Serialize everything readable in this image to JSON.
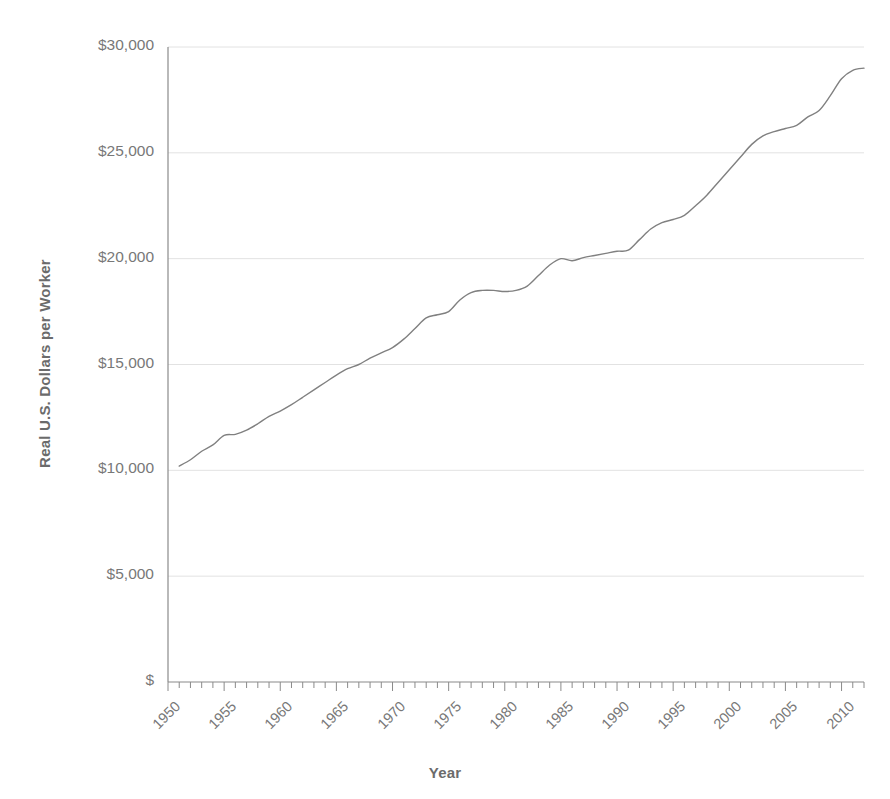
{
  "figure": {
    "background_color": "#ffffff",
    "plot_area": {
      "left": 168,
      "right": 864,
      "top": 47,
      "bottom": 682
    }
  },
  "axes": {
    "y_title": "Real U.S. Dollars per Worker",
    "x_title": "Year",
    "y_tick_labels": [
      "$30,000",
      "$25,000",
      "$20,000",
      "$15,000",
      "$10,000",
      "$5,000",
      "$"
    ],
    "y_tick_values": [
      30000,
      25000,
      20000,
      15000,
      10000,
      5000,
      0
    ],
    "x_tick_labels": [
      "1950",
      "1955",
      "1960",
      "1965",
      "1970",
      "1975",
      "1980",
      "1985",
      "1990",
      "1995",
      "2000",
      "2005",
      "2010"
    ],
    "x_tick_values": [
      1950,
      1955,
      1960,
      1965,
      1970,
      1975,
      1980,
      1985,
      1990,
      1995,
      2000,
      2005,
      2010
    ],
    "minor_tick_interval_years": 1,
    "grid": "horizontal",
    "grid_color": "#e2e2e2",
    "axis_line_color": "#8a8a8a",
    "tick_text_color": "#787878",
    "title_text_color": "#6b6b6b"
  },
  "chart_data": {
    "type": "line",
    "title": "",
    "subtitle": "",
    "xlabel": "Year",
    "ylabel": "Real U.S. Dollars per Worker",
    "xlim": [
      1950,
      2012
    ],
    "ylim": [
      0,
      30000
    ],
    "grid": true,
    "legend": "none",
    "line_color": "#808080",
    "line_width": 1.4,
    "x": [
      1951,
      1952,
      1953,
      1954,
      1955,
      1956,
      1957,
      1958,
      1959,
      1960,
      1961,
      1962,
      1963,
      1964,
      1965,
      1966,
      1967,
      1968,
      1969,
      1970,
      1971,
      1972,
      1973,
      1974,
      1975,
      1976,
      1977,
      1978,
      1979,
      1980,
      1981,
      1982,
      1983,
      1984,
      1985,
      1986,
      1987,
      1988,
      1989,
      1990,
      1991,
      1992,
      1993,
      1994,
      1995,
      1996,
      1997,
      1998,
      1999,
      2000,
      2001,
      2002,
      2003,
      2004,
      2005,
      2006,
      2007,
      2008,
      2009,
      2010,
      2011,
      2012
    ],
    "values": [
      10200,
      10500,
      10900,
      11200,
      11650,
      11700,
      11900,
      12200,
      12550,
      12800,
      13100,
      13450,
      13800,
      14150,
      14500,
      14800,
      15000,
      15300,
      15550,
      15800,
      16200,
      16700,
      17200,
      17350,
      17500,
      18050,
      18400,
      18500,
      18500,
      18450,
      18500,
      18700,
      19200,
      19700,
      20000,
      19900,
      20050,
      20150,
      20250,
      20350,
      20400,
      20900,
      21400,
      21700,
      21850,
      22050,
      22500,
      23000,
      23600,
      24200,
      24800,
      25400,
      25800,
      26000,
      26150,
      26300,
      26700,
      27000,
      27700,
      28500,
      28900,
      29000
    ],
    "units": "Real U.S. Dollars per Worker",
    "value_at_start": 10200,
    "value_at_end": 29000
  }
}
